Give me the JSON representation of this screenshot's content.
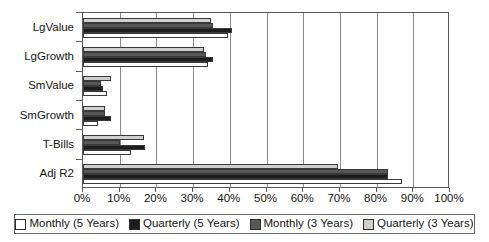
{
  "chart_data": {
    "type": "bar",
    "orientation": "horizontal",
    "title": "",
    "xlabel": "",
    "ylabel": "",
    "xlim": [
      0,
      100
    ],
    "xtick_labels": [
      "0%",
      "10%",
      "20%",
      "30%",
      "40%",
      "50%",
      "60%",
      "70%",
      "80%",
      "90%",
      "100%"
    ],
    "xtick_values": [
      0,
      10,
      20,
      30,
      40,
      50,
      60,
      70,
      80,
      90,
      100
    ],
    "grid": true,
    "legend_position": "bottom",
    "categories": [
      "LgValue",
      "LgGrowth",
      "SmValue",
      "SmGrowth",
      "T-Bills",
      "Adj R2"
    ],
    "series": [
      {
        "name": "Monthly (5 Years)",
        "color": "#ffffff",
        "values": [
          39.5,
          34.0,
          6.5,
          4.0,
          13.0,
          87.0
        ]
      },
      {
        "name": "Quarterly (5 Years)",
        "color": "#1d1d1d",
        "values": [
          40.5,
          35.5,
          5.5,
          7.5,
          17.0,
          83.0
        ]
      },
      {
        "name": "Monthly (3 Years)",
        "color": "#575757",
        "values": [
          35.5,
          33.5,
          5.0,
          6.0,
          10.0,
          83.0
        ]
      },
      {
        "name": "Quarterly (3 Years)",
        "color": "#cfcfcf",
        "values": [
          35.0,
          33.0,
          7.5,
          6.0,
          16.5,
          69.5
        ]
      }
    ]
  },
  "legend": {
    "items": [
      {
        "label": "Monthly (5 Years)",
        "swatch": "#ffffff"
      },
      {
        "label": "Quarterly (5 Years)",
        "swatch": "#1d1d1d"
      },
      {
        "label": "Monthly (3 Years)",
        "swatch": "#575757"
      },
      {
        "label": "Quarterly (3 Years)",
        "swatch": "#cfcfcf"
      }
    ]
  }
}
